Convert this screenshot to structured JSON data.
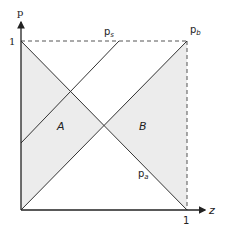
{
  "diagram": {
    "axes": {
      "y_label": "p",
      "x_label": "z",
      "y_tick": "1",
      "x_tick": "1"
    },
    "lines": {
      "ps_label": "p",
      "ps_sub": "s",
      "pb_label": "p",
      "pb_sub": "b",
      "pa_label": "p",
      "pa_sub": "a"
    },
    "regions": {
      "a_label": "A",
      "b_label": "B"
    },
    "colors": {
      "shade": "#ececec",
      "line": "#333333",
      "dash": "#555555"
    }
  }
}
